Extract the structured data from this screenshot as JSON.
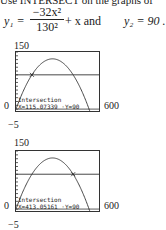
{
  "intro_text": "Use INTERSECT on the graphs of",
  "equation1": {
    "lhs": "y₁ =",
    "numerator": "−32x²",
    "denominator": "130²",
    "tail": "+ x  and"
  },
  "equation2": "y₂ = 90 .",
  "graphs": [
    {
      "ymax_label": "150",
      "ymin_label": "−5",
      "xmin_label": "0",
      "xmax_label": "600",
      "readout_title": "Intersection",
      "readout_values": "X=115.07339 ·Y=90",
      "intersection_x": 115.07339,
      "intersection_y": 90
    },
    {
      "ymax_label": "150",
      "ymin_label": "−5",
      "xmin_label": "0",
      "xmax_label": "600",
      "readout_title": "Intersection",
      "readout_values": "X=413.05161 ·Y=90",
      "intersection_x": 413.05161,
      "intersection_y": 90
    }
  ],
  "window": {
    "xmin": 0,
    "xmax": 600,
    "ymin": -5,
    "ymax": 150
  },
  "horizontal_line_y": 90
}
